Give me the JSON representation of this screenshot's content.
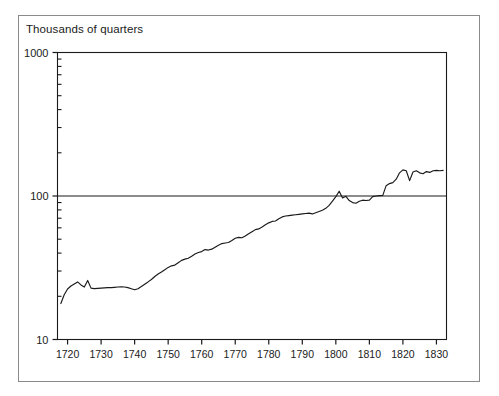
{
  "chart_data": {
    "type": "line",
    "title": "Thousands of quarters",
    "xlabel": "",
    "ylabel": "",
    "yscale": "log",
    "ylim": [
      10,
      1000
    ],
    "xlim": [
      1717,
      1833
    ],
    "grid": false,
    "gridlines": [
      100
    ],
    "legend": null,
    "y_tick_labels": [
      "1000",
      "100",
      "10"
    ],
    "y_tick_values": [
      1000,
      100,
      10
    ],
    "y_minor_ticks": [
      20,
      30,
      40,
      50,
      60,
      70,
      80,
      90,
      200,
      300,
      400,
      500,
      600,
      700,
      800,
      900
    ],
    "x_tick_labels": [
      "1720",
      "1730",
      "1740",
      "1750",
      "1760",
      "1770",
      "1780",
      "1790",
      "1800",
      "1810",
      "1820",
      "1830"
    ],
    "x_tick_values": [
      1720,
      1730,
      1740,
      1750,
      1760,
      1770,
      1780,
      1790,
      1800,
      1810,
      1820,
      1830
    ],
    "line_color": "#1a1a1a",
    "series": [
      {
        "name": "Thousands of quarters",
        "x": [
          1718,
          1719,
          1720,
          1721,
          1722,
          1723,
          1724,
          1725,
          1726,
          1727,
          1728,
          1729,
          1730,
          1731,
          1732,
          1733,
          1734,
          1735,
          1736,
          1737,
          1738,
          1739,
          1740,
          1741,
          1742,
          1743,
          1744,
          1745,
          1746,
          1747,
          1748,
          1749,
          1750,
          1751,
          1752,
          1753,
          1754,
          1755,
          1756,
          1757,
          1758,
          1759,
          1760,
          1761,
          1762,
          1763,
          1764,
          1765,
          1766,
          1767,
          1768,
          1769,
          1770,
          1771,
          1772,
          1773,
          1774,
          1775,
          1776,
          1777,
          1778,
          1779,
          1780,
          1781,
          1782,
          1783,
          1784,
          1785,
          1786,
          1787,
          1788,
          1789,
          1790,
          1791,
          1792,
          1793,
          1794,
          1795,
          1796,
          1797,
          1798,
          1799,
          1800,
          1801,
          1802,
          1803,
          1804,
          1805,
          1806,
          1807,
          1808,
          1809,
          1810,
          1811,
          1812,
          1813,
          1814,
          1815,
          1816,
          1817,
          1818,
          1819,
          1820,
          1821,
          1822,
          1823,
          1824,
          1825,
          1826,
          1827,
          1828,
          1829,
          1830,
          1831,
          1832
        ],
        "values": [
          17.8,
          20.5,
          22.5,
          23.6,
          24.4,
          25.2,
          24.0,
          23.2,
          25.8,
          22.8,
          22.6,
          22.7,
          22.8,
          22.9,
          23.0,
          23.0,
          23.1,
          23.2,
          23.3,
          23.2,
          23.0,
          22.6,
          22.2,
          22.6,
          23.4,
          24.3,
          25.2,
          26.2,
          27.5,
          28.6,
          29.5,
          30.6,
          31.8,
          32.6,
          33.0,
          34.3,
          35.6,
          36.3,
          36.8,
          38.0,
          39.4,
          40.4,
          41.0,
          42.3,
          42.0,
          42.6,
          44.0,
          45.4,
          46.6,
          47.0,
          47.4,
          49.0,
          50.8,
          51.5,
          51.2,
          52.6,
          54.5,
          56.4,
          58.3,
          59.0,
          60.8,
          63.0,
          65.0,
          66.5,
          67.0,
          69.5,
          71.5,
          72.5,
          73.0,
          73.5,
          74.0,
          74.5,
          75.0,
          75.5,
          76.0,
          75.0,
          76.5,
          78.0,
          79.5,
          82.0,
          86.0,
          92.0,
          99.0,
          108.0,
          97.0,
          99.5,
          93.0,
          90.0,
          89.0,
          92.0,
          93.5,
          93.0,
          93.5,
          99.0,
          100.0,
          100.5,
          101.0,
          118.0,
          122.0,
          124.0,
          131.0,
          145.0,
          152.0,
          150.0,
          128.0,
          147.0,
          150.0,
          145.0,
          143.0,
          148.0,
          146.0,
          150.0,
          151.0,
          150.0,
          151.0
        ]
      }
    ]
  }
}
